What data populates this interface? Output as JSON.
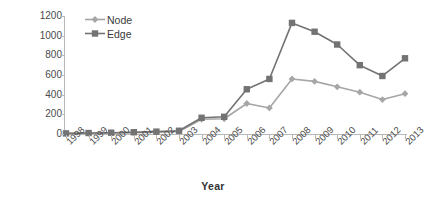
{
  "chart_data": {
    "type": "line",
    "title": "",
    "xlabel": "Year",
    "ylabel": "Thousands",
    "categories": [
      "1998",
      "1999",
      "2000",
      "2001",
      "2002",
      "2003",
      "2004",
      "2005",
      "2006",
      "2007",
      "2008",
      "2009",
      "2010",
      "2011",
      "2012",
      "2013"
    ],
    "series": [
      {
        "name": "Node",
        "color": "#a6a6a6",
        "marker": "diamond",
        "values": [
          5,
          8,
          10,
          14,
          18,
          26,
          150,
          155,
          310,
          265,
          560,
          535,
          480,
          425,
          350,
          410
        ]
      },
      {
        "name": "Edge",
        "color": "#737373",
        "marker": "square",
        "values": [
          6,
          10,
          13,
          18,
          24,
          33,
          165,
          175,
          455,
          560,
          1130,
          1040,
          910,
          700,
          590,
          770
        ]
      }
    ],
    "ylim": [
      0,
      1200
    ],
    "yticks": [
      0,
      200,
      400,
      600,
      800,
      1000,
      1200
    ],
    "ytick_labels": [
      "0",
      "200",
      "400",
      "600",
      "800",
      "1000",
      "1200"
    ],
    "grid": false,
    "legend_position": "top-left",
    "axis_color": "#b8b8b8"
  },
  "legend": {
    "entries": [
      {
        "label": "Node"
      },
      {
        "label": "Edge"
      }
    ]
  },
  "axes": {
    "y_title": "Thousands",
    "x_title": "Year"
  }
}
